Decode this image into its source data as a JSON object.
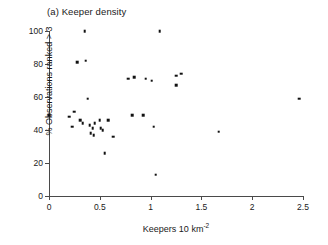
{
  "figure": {
    "panel_title": "(a) Keeper density"
  },
  "chart_data": {
    "type": "scatter",
    "title": "(a) Keeper density",
    "xlabel": "Keepers 10 km",
    "xlabel_exponent": "-2",
    "ylabel": "% Observations ranked > 3",
    "xlim": [
      0,
      2.5
    ],
    "ylim": [
      0,
      100
    ],
    "xticks": [
      0,
      0.5,
      1,
      1.5,
      2,
      2.5
    ],
    "xtick_labels": [
      "0",
      "0.5",
      "1",
      "1.5",
      "2",
      "2.5"
    ],
    "yticks": [
      0,
      20,
      40,
      60,
      80,
      100
    ],
    "ytick_labels": [
      "0",
      "20",
      "40",
      "60",
      "80",
      "100"
    ],
    "grid": false,
    "legend": false,
    "marker": "square",
    "marker_color": "#111111",
    "axis_color": "#4a4a4a",
    "points": [
      {
        "x": 0.0,
        "y": 49
      },
      {
        "x": 0.2,
        "y": 48
      },
      {
        "x": 0.23,
        "y": 42
      },
      {
        "x": 0.25,
        "y": 51
      },
      {
        "x": 0.28,
        "y": 81
      },
      {
        "x": 0.31,
        "y": 46
      },
      {
        "x": 0.33,
        "y": 44
      },
      {
        "x": 0.35,
        "y": 100
      },
      {
        "x": 0.36,
        "y": 82
      },
      {
        "x": 0.38,
        "y": 59
      },
      {
        "x": 0.4,
        "y": 43
      },
      {
        "x": 0.41,
        "y": 38
      },
      {
        "x": 0.43,
        "y": 41
      },
      {
        "x": 0.44,
        "y": 37
      },
      {
        "x": 0.45,
        "y": 44
      },
      {
        "x": 0.5,
        "y": 46
      },
      {
        "x": 0.51,
        "y": 41
      },
      {
        "x": 0.53,
        "y": 40
      },
      {
        "x": 0.55,
        "y": 26
      },
      {
        "x": 0.58,
        "y": 46
      },
      {
        "x": 0.63,
        "y": 36
      },
      {
        "x": 0.78,
        "y": 71
      },
      {
        "x": 0.82,
        "y": 49
      },
      {
        "x": 0.84,
        "y": 72
      },
      {
        "x": 0.93,
        "y": 49
      },
      {
        "x": 0.95,
        "y": 71
      },
      {
        "x": 1.01,
        "y": 70
      },
      {
        "x": 1.03,
        "y": 42
      },
      {
        "x": 1.05,
        "y": 13
      },
      {
        "x": 1.09,
        "y": 100
      },
      {
        "x": 1.25,
        "y": 73
      },
      {
        "x": 1.25,
        "y": 67
      },
      {
        "x": 1.3,
        "y": 74
      },
      {
        "x": 1.67,
        "y": 39
      },
      {
        "x": 2.46,
        "y": 59
      }
    ]
  }
}
